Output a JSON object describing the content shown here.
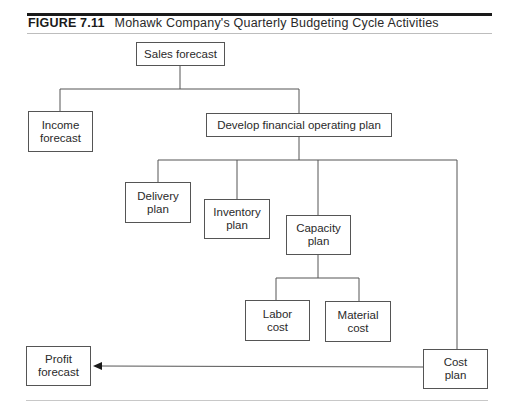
{
  "figure": {
    "number": "FIGURE 7.11",
    "title": "Mohawk Company's Quarterly Budgeting Cycle Activities"
  },
  "nodes": {
    "sales_forecast": "Sales forecast",
    "income_forecast_1": "Income",
    "income_forecast_2": "forecast",
    "develop_plan": "Develop financial operating plan",
    "delivery_plan_1": "Delivery",
    "delivery_plan_2": "plan",
    "inventory_plan_1": "Inventory",
    "inventory_plan_2": "plan",
    "capacity_plan_1": "Capacity",
    "capacity_plan_2": "plan",
    "labor_cost_1": "Labor",
    "labor_cost_2": "cost",
    "material_cost_1": "Material",
    "material_cost_2": "cost",
    "cost_plan_1": "Cost",
    "cost_plan_2": "plan",
    "profit_forecast_1": "Profit",
    "profit_forecast_2": "forecast"
  },
  "edges": [
    {
      "from": "Sales forecast",
      "to": "Income forecast"
    },
    {
      "from": "Sales forecast",
      "to": "Develop financial operating plan"
    },
    {
      "from": "Develop financial operating plan",
      "to": "Delivery plan"
    },
    {
      "from": "Develop financial operating plan",
      "to": "Inventory plan"
    },
    {
      "from": "Develop financial operating plan",
      "to": "Capacity plan"
    },
    {
      "from": "Develop financial operating plan",
      "to": "Cost plan"
    },
    {
      "from": "Capacity plan",
      "to": "Labor cost"
    },
    {
      "from": "Capacity plan",
      "to": "Material cost"
    },
    {
      "from": "Cost plan",
      "to": "Profit forecast",
      "arrow": true
    }
  ],
  "colors": {
    "line": "#555555",
    "rule": "#1a1a1a"
  }
}
